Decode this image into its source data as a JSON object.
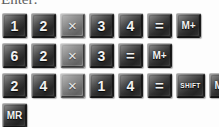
{
  "instruction": {
    "text": "Enter:"
  },
  "colors": {
    "background": "#fdfdfd",
    "key_face_dark": "#343434",
    "key_face_light": "#8c8c8c",
    "key_label": "#f2f2f2",
    "key_highlight": "#b8b8b8",
    "key_shadow": "#141414",
    "instruction_text": "#3a3a3a"
  },
  "keypad": {
    "rows": [
      {
        "name": "sequence-row-1",
        "expression": "12 x 34 = M+",
        "keys": [
          {
            "label": "1",
            "type": "digit",
            "icon": "key-1"
          },
          {
            "label": "2",
            "type": "digit",
            "icon": "key-2"
          },
          {
            "label": "×",
            "type": "operator-multiply",
            "icon": "multiply-icon"
          },
          {
            "label": "3",
            "type": "digit",
            "icon": "key-3"
          },
          {
            "label": "4",
            "type": "digit",
            "icon": "key-4"
          },
          {
            "label": "=",
            "type": "operator-equals",
            "icon": "equals-icon"
          },
          {
            "label": "M+",
            "type": "memory-add",
            "icon": "memory-add-icon"
          }
        ]
      },
      {
        "name": "sequence-row-2",
        "expression": "62 x 3 = M+",
        "keys": [
          {
            "label": "6",
            "type": "digit",
            "icon": "key-6"
          },
          {
            "label": "2",
            "type": "digit",
            "icon": "key-2"
          },
          {
            "label": "×",
            "type": "operator-multiply",
            "icon": "multiply-icon"
          },
          {
            "label": "3",
            "type": "digit",
            "icon": "key-3"
          },
          {
            "label": "=",
            "type": "operator-equals",
            "icon": "equals-icon"
          },
          {
            "label": "M+",
            "type": "memory-add",
            "icon": "memory-add-icon"
          }
        ]
      },
      {
        "name": "sequence-row-3",
        "expression": "24 x 14 = SHIFT M+",
        "keys": [
          {
            "label": "2",
            "type": "digit",
            "icon": "key-2"
          },
          {
            "label": "4",
            "type": "digit",
            "icon": "key-4"
          },
          {
            "label": "×",
            "type": "operator-multiply",
            "icon": "multiply-icon"
          },
          {
            "label": "1",
            "type": "digit",
            "icon": "key-1"
          },
          {
            "label": "4",
            "type": "digit",
            "icon": "key-4"
          },
          {
            "label": "=",
            "type": "operator-equals",
            "icon": "equals-icon"
          },
          {
            "label": "SHIFT",
            "type": "modifier",
            "icon": "shift-icon"
          },
          {
            "label": "M+",
            "type": "memory-add",
            "icon": "memory-add-icon"
          }
        ]
      },
      {
        "name": "sequence-row-4",
        "expression": "MR",
        "keys": [
          {
            "label": "MR",
            "type": "memory-recall",
            "icon": "memory-recall-icon"
          }
        ]
      }
    ]
  }
}
